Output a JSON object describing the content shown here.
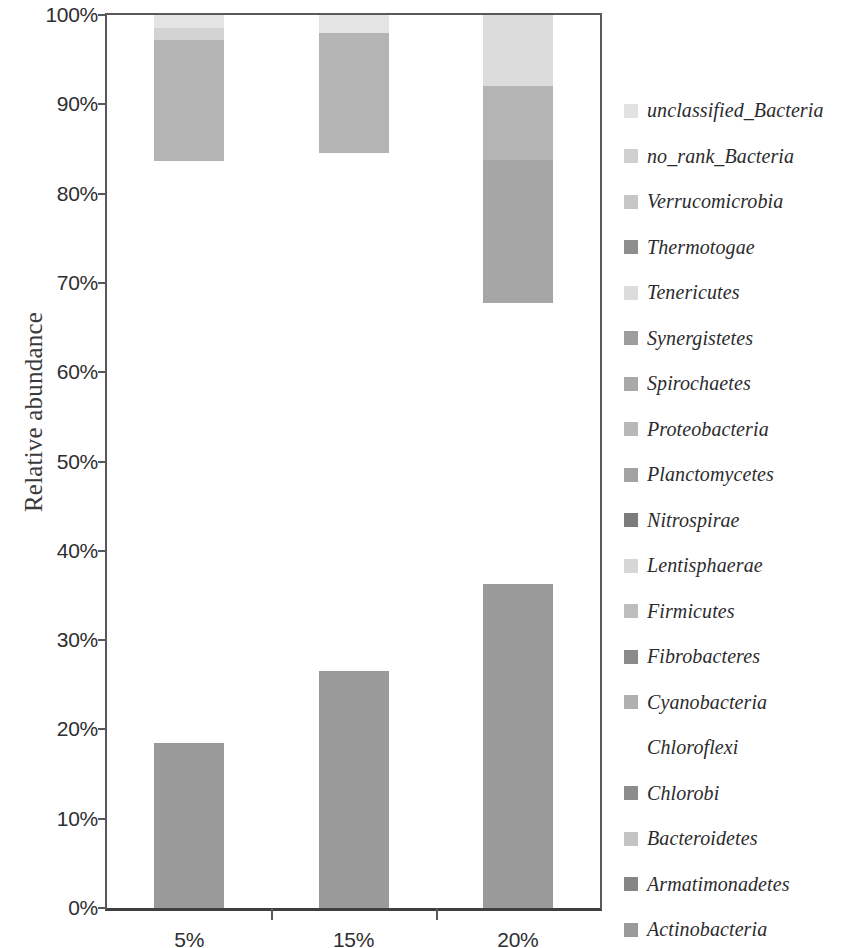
{
  "chart_data": {
    "type": "bar",
    "subtype": "stacked-bar-100-percent",
    "title": "",
    "xlabel": "",
    "ylabel": "Relative abundance",
    "categories": [
      "5%",
      "15%",
      "20%"
    ],
    "ylim": [
      0,
      100
    ],
    "ytick_labels": [
      "0%",
      "10%",
      "20%",
      "30%",
      "40%",
      "50%",
      "60%",
      "70%",
      "80%",
      "90%",
      "100%"
    ],
    "ytick_values": [
      0,
      10,
      20,
      30,
      40,
      50,
      60,
      70,
      80,
      90,
      100
    ],
    "grid": false,
    "legend_position": "right",
    "axis_color": "#59595b",
    "series": [
      {
        "name": "unclassified_Bacteria",
        "color": "#e8e8e8",
        "values": [
          1.5,
          2.0,
          8.0
        ]
      },
      {
        "name": "no_rank_Bacteria",
        "color": "#d2d2d2",
        "values": [
          1.3,
          0.0,
          0.0
        ]
      },
      {
        "name": "Verrucomicrobia",
        "color": "#c9c9c9",
        "values": [
          0.0,
          0.0,
          0.0
        ]
      },
      {
        "name": "Thermotogae",
        "color": "#8e8e8e",
        "values": [
          0.0,
          0.0,
          0.0
        ]
      },
      {
        "name": "Tenericutes",
        "color": "#e0e0e0",
        "values": [
          0.0,
          0.0,
          0.0
        ]
      },
      {
        "name": "Synergistetes",
        "color": "#9d9d9d",
        "values": [
          0.0,
          0.0,
          0.0
        ]
      },
      {
        "name": "Spirochaetes",
        "color": "#a8a8a8",
        "values": [
          0.0,
          0.0,
          0.0
        ]
      },
      {
        "name": "Proteobacteria",
        "color": "#b4b4b4",
        "values": [
          13.5,
          13.5,
          8.2
        ]
      },
      {
        "name": "Planctomycetes",
        "color": "#a0a0a0",
        "values": [
          0.0,
          0.0,
          16.0
        ]
      },
      {
        "name": "Nitrospirae",
        "color": "#7e7e7e",
        "values": [
          0.0,
          0.0,
          0.0
        ]
      },
      {
        "name": "Lentisphaerae",
        "color": "#d8d8d8",
        "values": [
          0.0,
          0.0,
          0.0
        ]
      },
      {
        "name": "Firmicutes",
        "color": "#bdbdbd",
        "values": [
          0.0,
          0.0,
          0.0
        ]
      },
      {
        "name": "Fibrobacteres",
        "color": "#8a8a8a",
        "values": [
          0.0,
          0.0,
          0.0
        ]
      },
      {
        "name": "Cyanobacteria",
        "color": "#b0b0b0",
        "values": [
          0.0,
          0.0,
          0.0
        ]
      },
      {
        "name": "Chloroflexi",
        "color": "#ffffff",
        "values": [
          65.2,
          58.0,
          31.5
        ]
      },
      {
        "name": "Chlorobi",
        "color": "#8c8c8c",
        "values": [
          0.0,
          0.0,
          0.0
        ]
      },
      {
        "name": "Bacteroidetes",
        "color": "#c4c4c4",
        "values": [
          0.0,
          0.0,
          0.0
        ]
      },
      {
        "name": "Armatimonadetes",
        "color": "#858585",
        "values": [
          0.0,
          0.0,
          0.0
        ]
      },
      {
        "name": "Actinobacteria",
        "color": "#9a9a9a",
        "values": [
          18.5,
          26.5,
          36.3
        ]
      }
    ],
    "bars": [
      {
        "category": "5%",
        "segments": [
          {
            "name": "Chloroflexi",
            "from": 0.0,
            "to": 18.5,
            "color": "#9a9a9a",
            "label": "Actinobacteria"
          },
          {
            "name": "gap",
            "from": 18.5,
            "to": 83.7,
            "color": "#ffffff",
            "label": "Chloroflexi"
          },
          {
            "name": "Proteobacteria",
            "from": 83.7,
            "to": 97.2,
            "color": "#b4b4b4",
            "label": "Proteobacteria"
          },
          {
            "name": "no_rank_Bacteria",
            "from": 97.2,
            "to": 98.5,
            "color": "#d2d2d2",
            "label": "no_rank_Bacteria"
          },
          {
            "name": "unclassified_Bacteria",
            "from": 98.5,
            "to": 100.0,
            "color": "#e4e4e4",
            "label": "unclassified_Bacteria"
          }
        ]
      },
      {
        "category": "15%",
        "segments": [
          {
            "name": "Actinobacteria",
            "from": 0.0,
            "to": 26.5,
            "color": "#9a9a9a",
            "label": "Actinobacteria"
          },
          {
            "name": "gap",
            "from": 26.5,
            "to": 84.5,
            "color": "#ffffff",
            "label": "Chloroflexi"
          },
          {
            "name": "Proteobacteria",
            "from": 84.5,
            "to": 98.0,
            "color": "#b4b4b4",
            "label": "Proteobacteria"
          },
          {
            "name": "unclassified_Bacteria",
            "from": 98.0,
            "to": 100.0,
            "color": "#e4e4e4",
            "label": "unclassified_Bacteria"
          }
        ]
      },
      {
        "category": "20%",
        "segments": [
          {
            "name": "Actinobacteria",
            "from": 0.0,
            "to": 36.3,
            "color": "#9a9a9a",
            "label": "Actinobacteria"
          },
          {
            "name": "gap",
            "from": 36.3,
            "to": 67.8,
            "color": "#ffffff",
            "label": "Chloroflexi"
          },
          {
            "name": "Planctomycetes",
            "from": 67.8,
            "to": 83.8,
            "color": "#a6a6a6",
            "label": "Planctomycetes"
          },
          {
            "name": "Proteobacteria",
            "from": 83.8,
            "to": 92.0,
            "color": "#b4b4b4",
            "label": "Proteobacteria"
          },
          {
            "name": "unclassified_Bacteria",
            "from": 92.0,
            "to": 100.0,
            "color": "#dcdcdc",
            "label": "unclassified_Bacteria"
          }
        ]
      }
    ]
  },
  "axis": {
    "y_title": "Relative abundance"
  },
  "legend": {
    "items": [
      {
        "label": "unclassified_Bacteria",
        "color": "#e2e2e2"
      },
      {
        "label": "no_rank_Bacteria",
        "color": "#cfcfcf"
      },
      {
        "label": "Verrucomicrobia",
        "color": "#c6c6c6"
      },
      {
        "label": "Thermotogae",
        "color": "#8e8e8e"
      },
      {
        "label": "Tenericutes",
        "color": "#dcdcdc"
      },
      {
        "label": "Synergistetes",
        "color": "#9d9d9d"
      },
      {
        "label": "Spirochaetes",
        "color": "#a8a8a8"
      },
      {
        "label": "Proteobacteria",
        "color": "#b8b8b8"
      },
      {
        "label": "Planctomycetes",
        "color": "#a2a2a2"
      },
      {
        "label": "Nitrospirae",
        "color": "#7c7c7c"
      },
      {
        "label": "Lentisphaerae",
        "color": "#d6d6d6"
      },
      {
        "label": "Firmicutes",
        "color": "#bdbdbd"
      },
      {
        "label": "Fibrobacteres",
        "color": "#8a8a8a"
      },
      {
        "label": "Cyanobacteria",
        "color": "#b0b0b0"
      },
      {
        "label": "Chloroflexi",
        "color": "#ffffff"
      },
      {
        "label": "Chlorobi",
        "color": "#8c8c8c"
      },
      {
        "label": "Bacteroidetes",
        "color": "#c4c4c4"
      },
      {
        "label": "Armatimonadetes",
        "color": "#858585"
      },
      {
        "label": "Actinobacteria",
        "color": "#9a9a9a"
      }
    ]
  }
}
